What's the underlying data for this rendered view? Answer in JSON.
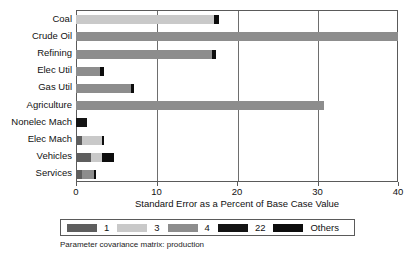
{
  "chart_data": {
    "type": "bar",
    "orientation": "horizontal",
    "stacked": true,
    "title": "",
    "xlabel": "Standard Error as a Percent of Base Case Value",
    "ylabel": "",
    "xlim": [
      0,
      40
    ],
    "ylim": null,
    "grid": true,
    "grid_axis": "x",
    "xticks": [
      0,
      10,
      20,
      30,
      40
    ],
    "xticklabels": [
      "0",
      "10",
      "20",
      "30",
      "40"
    ],
    "categories": [
      "Coal",
      "Crude Oil",
      "Refining",
      "Elec Util",
      "Gas Util",
      "Agriculture",
      "Nonelec Mach",
      "Elec Mach",
      "Vehicles",
      "Services"
    ],
    "legend_position": "below-axis",
    "series": [
      {
        "name": "1",
        "color": "#5e5e5e",
        "values": [
          0.0,
          0.0,
          0.0,
          0.0,
          0.0,
          0.0,
          0.0,
          0.8,
          1.9,
          0.7
        ]
      },
      {
        "name": "3",
        "color": "#c9c9c9",
        "values": [
          17.1,
          0.0,
          0.0,
          0.0,
          0.0,
          0.0,
          0.0,
          2.4,
          1.3,
          0.0
        ]
      },
      {
        "name": "4",
        "color": "#8d8d8d",
        "values": [
          0.0,
          40.0,
          16.9,
          3.0,
          6.8,
          30.8,
          0.0,
          0.0,
          0.0,
          1.5
        ]
      },
      {
        "name": "22",
        "color": "#141414",
        "values": [
          0.0,
          0.0,
          0.0,
          0.0,
          0.0,
          0.0,
          1.4,
          0.0,
          0.0,
          0.0
        ]
      },
      {
        "name": "Others",
        "color": "#0d0d0d",
        "values": [
          0.7,
          0.0,
          0.5,
          0.5,
          0.4,
          0.0,
          0.0,
          0.3,
          1.5,
          0.3
        ]
      }
    ],
    "totals": [
      17.8,
      40.0,
      17.4,
      3.5,
      7.2,
      30.8,
      1.4,
      3.5,
      4.7,
      2.5
    ],
    "caption": "Parameter covariance matrix: production"
  },
  "legend": {
    "entries": [
      {
        "label": "1",
        "color": "#5e5e5e"
      },
      {
        "label": "3",
        "color": "#c9c9c9"
      },
      {
        "label": "4",
        "color": "#8d8d8d"
      },
      {
        "label": "22",
        "color": "#141414"
      },
      {
        "label": "Others",
        "color": "#0d0d0d"
      }
    ]
  },
  "colors": {
    "axis": "#5a5a5a",
    "grid": "#6e6e6e",
    "text": "#111111",
    "background": "#ffffff"
  }
}
